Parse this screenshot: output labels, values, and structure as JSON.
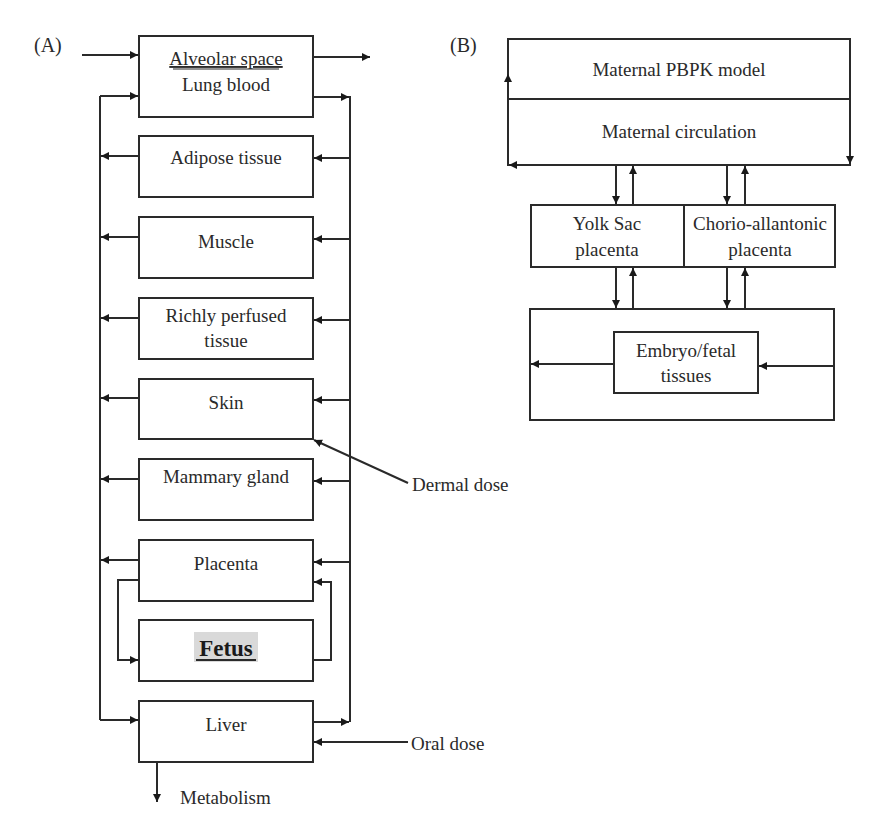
{
  "panel_a": {
    "label": "(A)",
    "lung": {
      "line1": "Alveolar space",
      "line2": "Lung blood"
    },
    "compartments": [
      {
        "line1": "Adipose tissue",
        "line2": ""
      },
      {
        "line1": "Muscle",
        "line2": ""
      },
      {
        "line1": "Richly perfused",
        "line2": "tissue"
      },
      {
        "line1": "Skin",
        "line2": ""
      },
      {
        "line1": "Mammary gland",
        "line2": ""
      },
      {
        "line1": "Placenta",
        "line2": ""
      },
      {
        "line1": "Fetus",
        "line2": ""
      },
      {
        "line1": "Liver",
        "line2": ""
      }
    ],
    "inputs": {
      "dermal": "Dermal dose",
      "oral": "Oral dose"
    },
    "outputs": {
      "metabolism": "Metabolism"
    },
    "highlight_color": "#d9d9d9"
  },
  "panel_b": {
    "label": "(B)",
    "maternal_model": "Maternal PBPK model",
    "maternal_circulation": "Maternal circulation",
    "yolk_sac": {
      "line1": "Yolk Sac",
      "line2": "placenta"
    },
    "chorio": {
      "line1": "Chorio-allantonic",
      "line2": "placenta"
    },
    "embryo": {
      "line1": "Embryo/fetal",
      "line2": "tissues"
    }
  }
}
